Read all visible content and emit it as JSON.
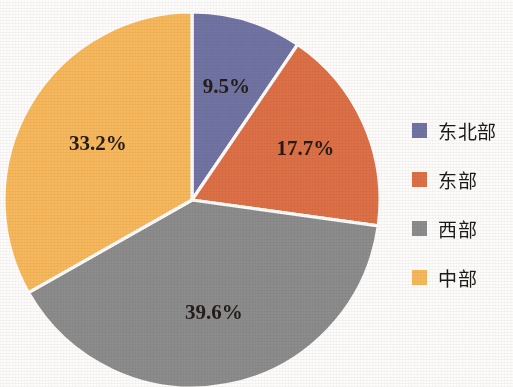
{
  "chart_data": {
    "type": "pie",
    "title": "",
    "subtitle": "",
    "xlabel": "",
    "ylabel": "",
    "grid": false,
    "legend_position": "right",
    "start_angle_clock": "12 o'clock",
    "direction": "clockwise",
    "value_unit": "%",
    "categories": [
      "东北部",
      "东部",
      "西部",
      "中部"
    ],
    "values": [
      9.5,
      17.7,
      39.6,
      33.2
    ],
    "data_labels": [
      "9.5%",
      "17.7%",
      "39.6%",
      "33.2%"
    ],
    "colors": [
      "#7173a3",
      "#dd7046",
      "#8c8c8c",
      "#f7b85c"
    ],
    "slices": [
      {
        "label": "东北部",
        "value": 9.5,
        "data_label": "9.5%",
        "color": "#7173a3"
      },
      {
        "label": "东部",
        "value": 17.7,
        "data_label": "17.7%",
        "color": "#dd7046"
      },
      {
        "label": "西部",
        "value": 39.6,
        "data_label": "39.6%",
        "color": "#8c8c8c"
      },
      {
        "label": "中部",
        "value": 33.2,
        "data_label": "33.2%",
        "color": "#f7b85c"
      }
    ]
  },
  "legend": {
    "items": [
      {
        "label": "东北部",
        "color": "#7173a3"
      },
      {
        "label": "东部",
        "color": "#dd7046"
      },
      {
        "label": "西部",
        "color": "#8c8c8c"
      },
      {
        "label": "中部",
        "color": "#f7b85c"
      }
    ]
  },
  "figure": {
    "background_color": "#fdfcfa",
    "label_text_color": "#241c18"
  }
}
